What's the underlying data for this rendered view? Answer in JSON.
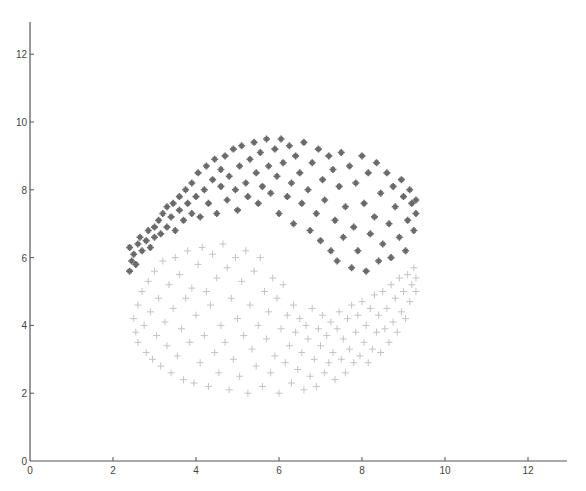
{
  "chart_data": {
    "type": "scatter",
    "title": "",
    "xlabel": "",
    "ylabel": "",
    "xlim": [
      0,
      13
    ],
    "ylim": [
      0,
      13
    ],
    "grid": false,
    "legend": null,
    "x_ticks": [
      "0",
      "2",
      "4",
      "6",
      "8",
      "10",
      "12"
    ],
    "y_ticks": [
      "0",
      "2",
      "4",
      "6",
      "8",
      "10",
      "12"
    ],
    "series": [
      {
        "name": "class-1 (dark)",
        "marker": "star",
        "color": "#6a6a6a",
        "points": [
          [
            2.4,
            5.6
          ],
          [
            2.45,
            5.9
          ],
          [
            2.5,
            6.1
          ],
          [
            2.4,
            6.3
          ],
          [
            2.55,
            5.8
          ],
          [
            2.6,
            6.4
          ],
          [
            2.7,
            6.2
          ],
          [
            2.65,
            6.6
          ],
          [
            2.8,
            6.5
          ],
          [
            2.85,
            6.8
          ],
          [
            2.9,
            6.3
          ],
          [
            3.0,
            6.9
          ],
          [
            3.0,
            6.6
          ],
          [
            3.1,
            7.1
          ],
          [
            3.15,
            6.7
          ],
          [
            3.2,
            7.3
          ],
          [
            3.3,
            6.9
          ],
          [
            3.3,
            7.5
          ],
          [
            3.4,
            7.2
          ],
          [
            3.45,
            7.6
          ],
          [
            3.5,
            6.8
          ],
          [
            3.6,
            7.4
          ],
          [
            3.6,
            7.8
          ],
          [
            3.7,
            7.1
          ],
          [
            3.75,
            8.0
          ],
          [
            3.8,
            7.6
          ],
          [
            3.9,
            7.3
          ],
          [
            3.9,
            8.2
          ],
          [
            4.0,
            7.8
          ],
          [
            4.05,
            8.5
          ],
          [
            4.1,
            7.2
          ],
          [
            4.2,
            8.0
          ],
          [
            4.25,
            8.7
          ],
          [
            4.3,
            7.6
          ],
          [
            4.4,
            8.3
          ],
          [
            4.45,
            8.9
          ],
          [
            4.5,
            7.3
          ],
          [
            4.6,
            8.1
          ],
          [
            4.6,
            8.6
          ],
          [
            4.7,
            9.0
          ],
          [
            4.75,
            7.7
          ],
          [
            4.8,
            8.4
          ],
          [
            4.9,
            9.2
          ],
          [
            4.95,
            8.0
          ],
          [
            5.0,
            7.4
          ],
          [
            5.05,
            8.7
          ],
          [
            5.1,
            9.3
          ],
          [
            5.2,
            8.2
          ],
          [
            5.25,
            7.8
          ],
          [
            5.3,
            8.9
          ],
          [
            5.4,
            9.4
          ],
          [
            5.45,
            8.5
          ],
          [
            5.5,
            7.6
          ],
          [
            5.55,
            9.1
          ],
          [
            5.6,
            8.1
          ],
          [
            5.7,
            9.5
          ],
          [
            5.75,
            8.7
          ],
          [
            5.8,
            7.9
          ],
          [
            5.9,
            9.2
          ],
          [
            5.95,
            8.4
          ],
          [
            6.0,
            7.3
          ],
          [
            6.05,
            9.5
          ],
          [
            6.1,
            8.8
          ],
          [
            6.2,
            7.8
          ],
          [
            6.25,
            9.3
          ],
          [
            6.3,
            8.2
          ],
          [
            6.35,
            7.0
          ],
          [
            6.4,
            9.0
          ],
          [
            6.5,
            8.5
          ],
          [
            6.55,
            7.6
          ],
          [
            6.6,
            9.4
          ],
          [
            6.7,
            8.0
          ],
          [
            6.75,
            6.8
          ],
          [
            6.8,
            8.8
          ],
          [
            6.9,
            7.3
          ],
          [
            6.95,
            9.2
          ],
          [
            7.0,
            6.5
          ],
          [
            7.05,
            8.3
          ],
          [
            7.1,
            7.7
          ],
          [
            7.2,
            9.0
          ],
          [
            7.25,
            6.2
          ],
          [
            7.3,
            8.6
          ],
          [
            7.35,
            7.1
          ],
          [
            7.4,
            5.9
          ],
          [
            7.45,
            8.1
          ],
          [
            7.5,
            9.1
          ],
          [
            7.55,
            6.6
          ],
          [
            7.6,
            7.5
          ],
          [
            7.7,
            8.7
          ],
          [
            7.75,
            5.7
          ],
          [
            7.8,
            6.9
          ],
          [
            7.85,
            8.2
          ],
          [
            7.9,
            6.2
          ],
          [
            8.0,
            9.0
          ],
          [
            8.05,
            7.6
          ],
          [
            8.1,
            5.6
          ],
          [
            8.15,
            8.5
          ],
          [
            8.2,
            6.7
          ],
          [
            8.3,
            7.2
          ],
          [
            8.35,
            8.8
          ],
          [
            8.4,
            5.9
          ],
          [
            8.45,
            7.9
          ],
          [
            8.5,
            6.4
          ],
          [
            8.6,
            8.5
          ],
          [
            8.65,
            7.0
          ],
          [
            8.7,
            6.0
          ],
          [
            8.75,
            8.1
          ],
          [
            8.8,
            7.5
          ],
          [
            8.9,
            6.6
          ],
          [
            8.95,
            8.3
          ],
          [
            9.0,
            7.8
          ],
          [
            9.05,
            6.2
          ],
          [
            9.1,
            7.1
          ],
          [
            9.15,
            8.0
          ],
          [
            9.2,
            7.6
          ],
          [
            9.25,
            6.8
          ],
          [
            9.3,
            7.7
          ],
          [
            9.3,
            7.3
          ]
        ]
      },
      {
        "name": "class-2 (light)",
        "marker": "plus",
        "color": "#c4c4c4",
        "points": [
          [
            2.5,
            4.2
          ],
          [
            2.55,
            3.8
          ],
          [
            2.6,
            4.6
          ],
          [
            2.6,
            3.5
          ],
          [
            2.7,
            5.0
          ],
          [
            2.75,
            4.0
          ],
          [
            2.8,
            3.2
          ],
          [
            2.85,
            5.3
          ],
          [
            2.9,
            4.4
          ],
          [
            2.95,
            3.0
          ],
          [
            3.0,
            5.6
          ],
          [
            3.05,
            3.7
          ],
          [
            3.1,
            4.8
          ],
          [
            3.15,
            2.8
          ],
          [
            3.2,
            5.9
          ],
          [
            3.25,
            4.1
          ],
          [
            3.3,
            3.4
          ],
          [
            3.35,
            5.2
          ],
          [
            3.4,
            2.6
          ],
          [
            3.45,
            4.5
          ],
          [
            3.5,
            6.0
          ],
          [
            3.55,
            3.1
          ],
          [
            3.6,
            5.5
          ],
          [
            3.65,
            3.9
          ],
          [
            3.7,
            2.4
          ],
          [
            3.75,
            4.8
          ],
          [
            3.8,
            6.2
          ],
          [
            3.85,
            3.5
          ],
          [
            3.9,
            5.1
          ],
          [
            3.95,
            2.3
          ],
          [
            4.0,
            4.3
          ],
          [
            4.05,
            5.8
          ],
          [
            4.1,
            2.9
          ],
          [
            4.15,
            6.3
          ],
          [
            4.2,
            3.7
          ],
          [
            4.25,
            5.0
          ],
          [
            4.3,
            2.2
          ],
          [
            4.35,
            4.6
          ],
          [
            4.4,
            6.1
          ],
          [
            4.45,
            3.2
          ],
          [
            4.5,
            5.4
          ],
          [
            4.55,
            2.6
          ],
          [
            4.6,
            4.0
          ],
          [
            4.65,
            6.4
          ],
          [
            4.7,
            3.5
          ],
          [
            4.75,
            5.7
          ],
          [
            4.8,
            2.1
          ],
          [
            4.85,
            4.8
          ],
          [
            4.9,
            3.0
          ],
          [
            4.95,
            6.0
          ],
          [
            5.0,
            4.2
          ],
          [
            5.05,
            2.5
          ],
          [
            5.1,
            5.3
          ],
          [
            5.15,
            3.7
          ],
          [
            5.2,
            6.2
          ],
          [
            5.25,
            2.0
          ],
          [
            5.3,
            4.6
          ],
          [
            5.35,
            3.3
          ],
          [
            5.4,
            5.6
          ],
          [
            5.45,
            2.8
          ],
          [
            5.5,
            4.0
          ],
          [
            5.55,
            6.0
          ],
          [
            5.6,
            2.2
          ],
          [
            5.65,
            5.0
          ],
          [
            5.7,
            3.6
          ],
          [
            5.75,
            4.4
          ],
          [
            5.8,
            2.6
          ],
          [
            5.85,
            5.4
          ],
          [
            5.9,
            3.1
          ],
          [
            5.95,
            4.8
          ],
          [
            6.0,
            2.0
          ],
          [
            6.05,
            3.9
          ],
          [
            6.1,
            5.2
          ],
          [
            6.15,
            2.9
          ],
          [
            6.2,
            4.3
          ],
          [
            6.25,
            3.4
          ],
          [
            6.3,
            2.3
          ],
          [
            6.35,
            4.6
          ],
          [
            6.4,
            3.8
          ],
          [
            6.45,
            2.7
          ],
          [
            6.5,
            4.2
          ],
          [
            6.55,
            3.2
          ],
          [
            6.6,
            2.1
          ],
          [
            6.65,
            4.0
          ],
          [
            6.7,
            3.6
          ],
          [
            6.75,
            2.5
          ],
          [
            6.8,
            4.5
          ],
          [
            6.85,
            3.0
          ],
          [
            6.9,
            2.2
          ],
          [
            6.95,
            3.9
          ],
          [
            7.0,
            3.4
          ],
          [
            7.05,
            4.3
          ],
          [
            7.1,
            2.6
          ],
          [
            7.15,
            3.7
          ],
          [
            7.2,
            2.9
          ],
          [
            7.25,
            4.1
          ],
          [
            7.3,
            3.2
          ],
          [
            7.35,
            2.4
          ],
          [
            7.4,
            3.9
          ],
          [
            7.45,
            4.4
          ],
          [
            7.5,
            3.0
          ],
          [
            7.55,
            3.6
          ],
          [
            7.6,
            2.6
          ],
          [
            7.65,
            4.2
          ],
          [
            7.7,
            3.3
          ],
          [
            7.75,
            4.6
          ],
          [
            7.8,
            2.9
          ],
          [
            7.85,
            3.8
          ],
          [
            7.9,
            4.3
          ],
          [
            7.95,
            3.1
          ],
          [
            8.0,
            4.7
          ],
          [
            8.05,
            3.5
          ],
          [
            8.1,
            4.0
          ],
          [
            8.15,
            2.9
          ],
          [
            8.2,
            4.5
          ],
          [
            8.25,
            3.3
          ],
          [
            8.3,
            4.9
          ],
          [
            8.35,
            3.8
          ],
          [
            8.4,
            4.3
          ],
          [
            8.45,
            3.2
          ],
          [
            8.5,
            5.0
          ],
          [
            8.55,
            3.9
          ],
          [
            8.6,
            4.5
          ],
          [
            8.65,
            3.5
          ],
          [
            8.7,
            5.2
          ],
          [
            8.75,
            4.1
          ],
          [
            8.8,
            4.8
          ],
          [
            8.85,
            3.8
          ],
          [
            8.9,
            5.4
          ],
          [
            8.95,
            4.4
          ],
          [
            9.0,
            5.0
          ],
          [
            9.05,
            4.2
          ],
          [
            9.1,
            5.5
          ],
          [
            9.15,
            4.7
          ],
          [
            9.2,
            5.2
          ],
          [
            9.25,
            5.7
          ],
          [
            9.3,
            5.4
          ],
          [
            9.3,
            5.0
          ]
        ]
      }
    ]
  }
}
